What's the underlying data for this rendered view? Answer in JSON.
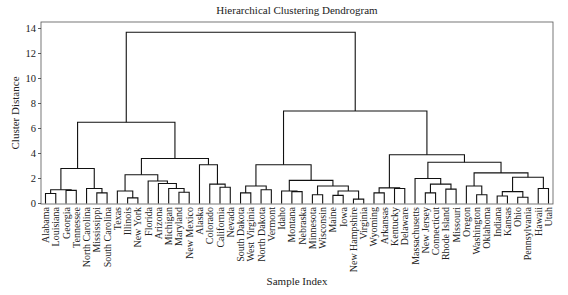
{
  "chart_data": {
    "type": "dendrogram",
    "title": "Hierarchical Clustering Dendrogram",
    "xlabel": "Sample Index",
    "ylabel": "Cluster Distance",
    "ylim": [
      0,
      14.3
    ],
    "yticks": [
      0,
      2,
      4,
      6,
      8,
      10,
      12,
      14
    ],
    "grid": false,
    "leaves": [
      "Alabama",
      "Louisiana",
      "Georgia",
      "Tennessee",
      "North Carolina",
      "Mississippi",
      "South Carolina",
      "Texas",
      "Illinois",
      "New York",
      "Florida",
      "Arizona",
      "Michigan",
      "Maryland",
      "New Mexico",
      "Alaska",
      "Colorado",
      "California",
      "Nevada",
      "South Dakota",
      "West Virginia",
      "North Dakota",
      "Vermont",
      "Idaho",
      "Montana",
      "Nebraska",
      "Minnesota",
      "Wisconsin",
      "Maine",
      "Iowa",
      "New Hampshire",
      "Virginia",
      "Wyoming",
      "Arkansas",
      "Kentucky",
      "Delaware",
      "Massachusetts",
      "New Jersey",
      "Connecticut",
      "Rhode Island",
      "Missouri",
      "Oregon",
      "Washington",
      "Oklahoma",
      "Indiana",
      "Kansas",
      "Ohio",
      "Pennsylvania",
      "Hawaii",
      "Utah"
    ],
    "tree": {
      "h": 13.7,
      "c": [
        {
          "h": 6.5,
          "c": [
            {
              "h": 2.8,
              "c": [
                {
                  "h": 1.1,
                  "c": [
                    {
                      "h": 0.8,
                      "c": [
                        0,
                        1
                      ]
                    },
                    {
                      "h": 1.05,
                      "c": [
                        2,
                        3
                      ]
                    }
                  ]
                },
                {
                  "h": 1.2,
                  "c": [
                    4,
                    {
                      "h": 0.85,
                      "c": [
                        5,
                        6
                      ]
                    }
                  ]
                }
              ]
            },
            {
              "h": 3.6,
              "c": [
                {
                  "h": 2.3,
                  "c": [
                    {
                      "h": 1.0,
                      "c": [
                        7,
                        {
                          "h": 0.45,
                          "c": [
                            8,
                            9
                          ]
                        }
                      ]
                    },
                    {
                      "h": 1.8,
                      "c": [
                        10,
                        {
                          "h": 1.6,
                          "c": [
                            11,
                            {
                              "h": 1.2,
                              "c": [
                                12,
                                {
                                  "h": 0.9,
                                  "c": [
                                    13,
                                    14
                                  ]
                                }
                              ]
                            }
                          ]
                        }
                      ]
                    }
                  ]
                },
                {
                  "h": 3.1,
                  "c": [
                    15,
                    {
                      "h": 1.55,
                      "c": [
                        16,
                        {
                          "h": 1.3,
                          "c": [
                            17,
                            18
                          ]
                        }
                      ]
                    }
                  ]
                }
              ]
            }
          ]
        },
        {
          "h": 7.4,
          "c": [
            {
              "h": 3.1,
              "c": [
                {
                  "h": 1.4,
                  "c": [
                    {
                      "h": 0.85,
                      "c": [
                        19,
                        20
                      ]
                    },
                    {
                      "h": 1.1,
                      "c": [
                        21,
                        22
                      ]
                    }
                  ]
                },
                {
                  "h": 1.85,
                  "c": [
                    {
                      "h": 1.0,
                      "c": [
                        23,
                        {
                          "h": 0.95,
                          "c": [
                            24,
                            25
                          ]
                        }
                      ]
                    },
                    {
                      "h": 1.4,
                      "c": [
                        {
                          "h": 0.7,
                          "c": [
                            26,
                            27
                          ]
                        },
                        {
                          "h": 1.0,
                          "c": [
                            {
                              "h": 0.65,
                              "c": [
                                28,
                                29
                              ]
                            },
                            {
                              "h": 0.35,
                              "c": [
                                30,
                                31
                              ]
                            }
                          ]
                        }
                      ]
                    }
                  ]
                }
              ]
            },
            {
              "h": 3.9,
              "c": [
                {
                  "h": 1.25,
                  "c": [
                    {
                      "h": 0.85,
                      "c": [
                        32,
                        33
                      ]
                    },
                    {
                      "h": 1.2,
                      "c": [
                        34,
                        35
                      ]
                    }
                  ]
                },
                {
                  "h": 3.3,
                  "c": [
                    {
                      "h": 2.0,
                      "c": [
                        36,
                        {
                          "h": 1.55,
                          "c": [
                            {
                              "h": 0.85,
                              "c": [
                                37,
                                38
                              ]
                            },
                            {
                              "h": 1.15,
                              "c": [
                                39,
                                40
                              ]
                            }
                          ]
                        }
                      ]
                    },
                    {
                      "h": 2.45,
                      "c": [
                        {
                          "h": 1.4,
                          "c": [
                            41,
                            {
                              "h": 0.7,
                              "c": [
                                42,
                                43
                              ]
                            }
                          ]
                        },
                        {
                          "h": 2.1,
                          "c": [
                            {
                              "h": 0.95,
                              "c": [
                                {
                                  "h": 0.6,
                                  "c": [
                                    44,
                                    45
                                  ]
                                },
                                {
                                  "h": 0.5,
                                  "c": [
                                    46,
                                    47
                                  ]
                                }
                              ]
                            },
                            {
                              "h": 1.2,
                              "c": [
                                48,
                                49
                              ]
                            }
                          ]
                        }
                      ]
                    }
                  ]
                }
              ]
            }
          ]
        }
      ]
    }
  }
}
